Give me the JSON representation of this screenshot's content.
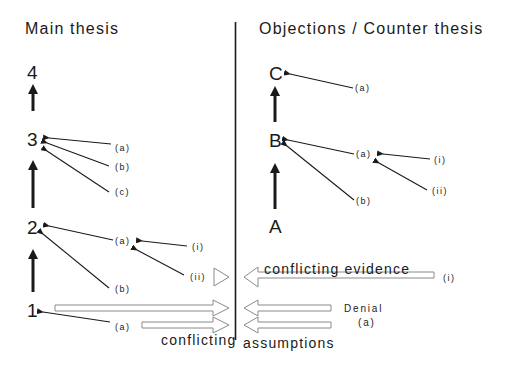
{
  "headings": {
    "left": "Main thesis",
    "right": "Objections / Counter thesis"
  },
  "main_thesis": {
    "nodes": [
      "1",
      "2",
      "3",
      "4"
    ],
    "supports": {
      "node3": [
        "(a)",
        "(b)",
        "(c)"
      ],
      "node2": [
        "(a)",
        "(b)"
      ],
      "node2a_sub": [
        "(i)",
        "(ii)"
      ],
      "node1": [
        "(a)"
      ]
    }
  },
  "counter_thesis": {
    "nodes": [
      "A",
      "B",
      "C"
    ],
    "supports": {
      "nodeC": [
        "(a)"
      ],
      "nodeB": [
        "(a)",
        "(b)"
      ],
      "nodeBa_sub": [
        "(i)",
        "(ii)"
      ]
    }
  },
  "conflicts": {
    "evidence_label": "conflicting evidence",
    "evidence_source": "(i)",
    "denial_label": "Denial",
    "denial_sub": "(a)",
    "assumptions_left": "conflicting",
    "assumptions_right": "assumptions"
  },
  "colors": {
    "ink": "#1a1a1a",
    "hollow_arrow_stroke": "#8a8a8a",
    "background": "#ffffff"
  }
}
